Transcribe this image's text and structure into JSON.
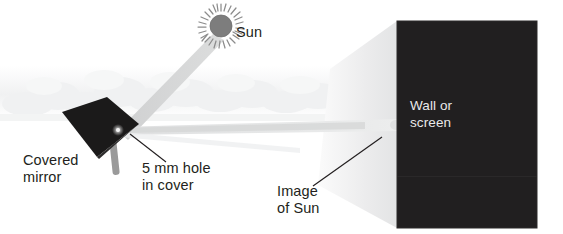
{
  "figure": {
    "background_color": "#ffffff"
  },
  "labels": {
    "sun": "Sun",
    "covered_mirror_line1": "Covered",
    "covered_mirror_line2": "mirror",
    "hole_line1": "5 mm hole",
    "hole_line2": "in cover",
    "image_of_sun_line1": "Image",
    "image_of_sun_line2": "of Sun",
    "wall_line1": "Wall or",
    "wall_line2": "screen"
  },
  "colors": {
    "text": "#231f20",
    "wall_fill": "#211f20",
    "wall_text": "#e9e9ea",
    "mirror_fill": "#1b1a1a",
    "post_fill": "#9a9a9a",
    "sun_disc": "#7d7d7d",
    "sun_rays": "#8c8c8c",
    "beam": "#d6d7d8",
    "beam_soft": "#e6e7e8",
    "floor_fill": "#ececed",
    "cloud": "#f2f3f4",
    "leader_line": "#231f20"
  },
  "icons": {
    "sun": "sun-icon",
    "mirror": "covered-mirror-icon",
    "wall": "wall-screen-icon",
    "beam_incoming": "incoming-sunbeam-icon",
    "beam_reflected": "reflected-sunbeam-icon",
    "clouds": "clouds-icon"
  },
  "geometry": {
    "sun_center_x": 221,
    "sun_center_y": 26,
    "sun_radius": 11,
    "sun_ray_count": 28,
    "wall_left": 397,
    "wall_top": 21,
    "wall_right": 537,
    "wall_bottom": 228,
    "mirror_hole_x": 118,
    "mirror_hole_y": 131
  }
}
